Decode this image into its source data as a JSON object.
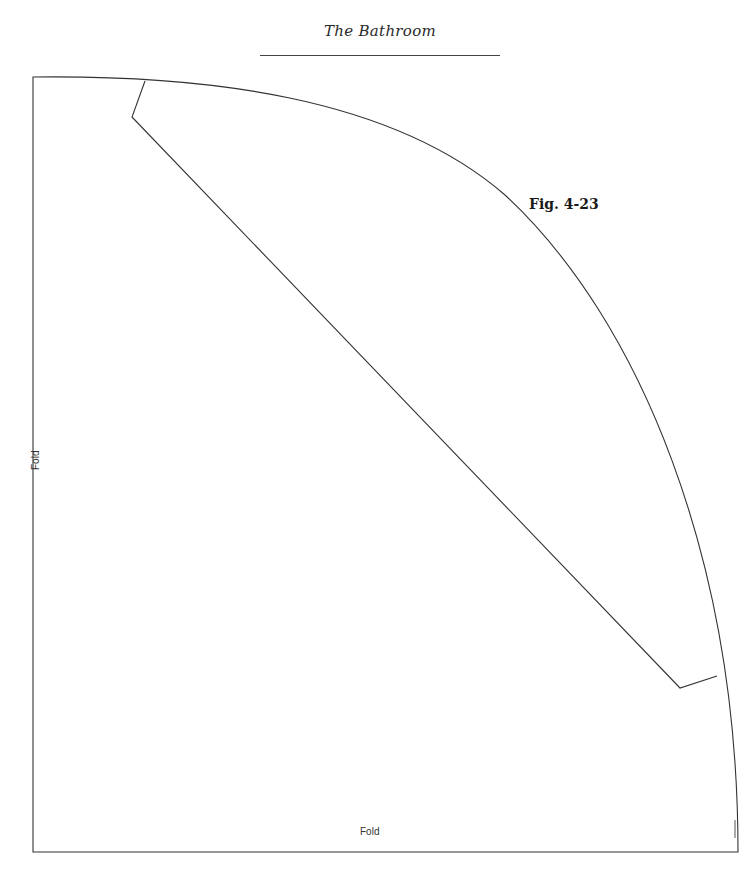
{
  "header": {
    "title": "The Bathroom"
  },
  "figure": {
    "label": "Fig. 4-23"
  },
  "labels": {
    "fold_left": "Fold",
    "fold_bottom": "Fold"
  },
  "colors": {
    "line": "#333333",
    "background": "#ffffff"
  }
}
